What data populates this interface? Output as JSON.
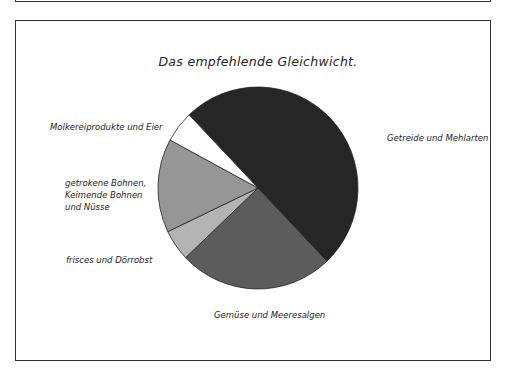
{
  "chart_data": {
    "type": "pie",
    "title": "Das empfehlende Gleichwicht.",
    "start_angle_deg": -133.6,
    "direction": "clockwise",
    "slices": [
      {
        "label": "Getreide und Mehlarten",
        "value": 50,
        "color": "#262626"
      },
      {
        "label": "Gemüse und Meeresalgen",
        "value": 25,
        "color": "#5c5c5c"
      },
      {
        "label": "frisces und Dörrobst",
        "value": 5,
        "color": "#b4b4b4"
      },
      {
        "label": "getrokene Bohnen, Keimende Bohnen und Nüsse",
        "value": 15,
        "color": "#969696"
      },
      {
        "label": "Molkereiprodukte und Eier",
        "value": 5,
        "color": "#ffffff"
      }
    ],
    "legend": "none (labels placed next to slices)"
  },
  "labels": {
    "title": "Das empfehlende Gleichwicht.",
    "getreide": "Getreide und Mehlarten",
    "gemuese": "Gemüse und Meeresalgen",
    "obst": "frisces und Dörrobst",
    "bohnen_line1": "getrokene Bohnen,",
    "bohnen_line2": "Keimende Bohnen",
    "bohnen_line3": "und Nüsse",
    "molkerei": "Molkereiprodukte und Eier"
  }
}
